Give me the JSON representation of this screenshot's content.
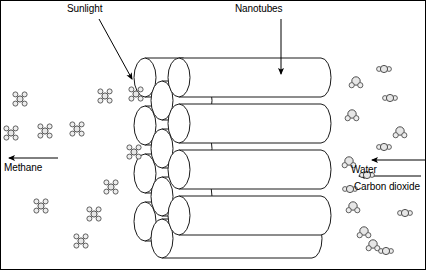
{
  "figure": {
    "background_color": "#ffffff",
    "border_color": "#000000",
    "line_color": "#1a1a1a",
    "molecule_fill": "#e6e6e6",
    "molecule_stroke": "#3c3c3c"
  },
  "labels": {
    "sunlight": "Sunlight",
    "nanotubes": "Nanotubes",
    "water": "Water",
    "carbon_dioxide": "Carbon dioxide",
    "methane": "Methane"
  },
  "arrows": [
    {
      "name": "sunlight-arrow",
      "label": "Sunlight",
      "x1": 98,
      "y1": 18,
      "x2": 131,
      "y2": 78,
      "direction": "down-right"
    },
    {
      "name": "nanotubes-arrow",
      "label": "Nanotubes",
      "x1": 280,
      "y1": 18,
      "x2": 280,
      "y2": 73,
      "direction": "down"
    },
    {
      "name": "water-arrow",
      "label": "Water",
      "x1": 426,
      "y1": 159,
      "x2": 371,
      "y2": 159,
      "direction": "left"
    },
    {
      "name": "carbon-dioxide-arrow",
      "label": "Carbon dioxide",
      "x1": 420,
      "y1": 175,
      "x2": 358,
      "y2": 175,
      "direction": "left"
    },
    {
      "name": "methane-arrow",
      "label": "Methane",
      "x1": 57,
      "y1": 157,
      "x2": 8,
      "y2": 157,
      "direction": "left"
    }
  ],
  "nanotubes": {
    "front_row": [
      {
        "name": "front-tube-1",
        "x": 178,
        "y": 57,
        "w": 152,
        "h": 39
      },
      {
        "name": "front-tube-2",
        "x": 178,
        "y": 103,
        "w": 152,
        "h": 39
      },
      {
        "name": "front-tube-3",
        "x": 178,
        "y": 149,
        "w": 152,
        "h": 39
      },
      {
        "name": "front-tube-4",
        "x": 178,
        "y": 195,
        "w": 152,
        "h": 39
      }
    ],
    "back_row": [
      {
        "name": "back-tube-1",
        "x": 144,
        "y": 57,
        "w": 48,
        "h": 39
      },
      {
        "name": "back-tube-2",
        "x": 144,
        "y": 105,
        "w": 48,
        "h": 39
      },
      {
        "name": "back-tube-3",
        "x": 144,
        "y": 153,
        "w": 48,
        "h": 39
      },
      {
        "name": "back-tube-4",
        "x": 144,
        "y": 201,
        "w": 48,
        "h": 39
      }
    ],
    "mid_row": [
      {
        "name": "mid-tube-1",
        "x": 161,
        "y": 80,
        "w": 50,
        "h": 39
      },
      {
        "name": "mid-tube-2",
        "x": 161,
        "y": 128,
        "w": 50,
        "h": 39
      },
      {
        "name": "mid-tube-3",
        "x": 161,
        "y": 176,
        "w": 50,
        "h": 39
      },
      {
        "name": "mid-tube-4",
        "x": 161,
        "y": 218,
        "w": 160,
        "h": 39
      }
    ]
  },
  "molecules": {
    "methane_label": "methane-molecule",
    "water_label": "water-molecule",
    "carbon_dioxide_label": "carbon-dioxide-molecule",
    "methane_positions": [
      {
        "x": 19,
        "y": 98
      },
      {
        "x": 44,
        "y": 130
      },
      {
        "x": 76,
        "y": 128
      },
      {
        "x": 104,
        "y": 95
      },
      {
        "x": 135,
        "y": 93
      },
      {
        "x": 133,
        "y": 151
      },
      {
        "x": 110,
        "y": 186
      },
      {
        "x": 40,
        "y": 205
      },
      {
        "x": 93,
        "y": 213
      },
      {
        "x": 80,
        "y": 240
      },
      {
        "x": 10,
        "y": 132
      }
    ],
    "water_positions": [
      {
        "x": 355,
        "y": 80
      },
      {
        "x": 351,
        "y": 113
      },
      {
        "x": 348,
        "y": 160
      },
      {
        "x": 399,
        "y": 130
      },
      {
        "x": 352,
        "y": 205
      },
      {
        "x": 372,
        "y": 243
      },
      {
        "x": 363,
        "y": 230
      }
    ],
    "co2_positions": [
      {
        "x": 383,
        "y": 68
      },
      {
        "x": 389,
        "y": 97
      },
      {
        "x": 383,
        "y": 146
      },
      {
        "x": 349,
        "y": 188
      },
      {
        "x": 404,
        "y": 212
      },
      {
        "x": 385,
        "y": 250
      },
      {
        "x": 366,
        "y": 174
      }
    ]
  }
}
